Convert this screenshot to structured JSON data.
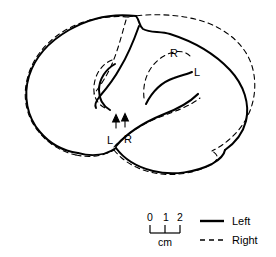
{
  "figure": {
    "type": "anatomical-line-drawing",
    "background_color": "#ffffff",
    "ink_color": "#000000"
  },
  "annotations": {
    "sylvian_left_label": "L",
    "sylvian_right_label": "R",
    "superior_right_label": "R",
    "superior_left_label": "L"
  },
  "scale_bar": {
    "ticks": [
      "0",
      "1",
      "2"
    ],
    "unit_label": "cm"
  },
  "legend": {
    "items": [
      {
        "label": "Left",
        "style": "solid",
        "color": "#000000"
      },
      {
        "label": "Right",
        "style": "dashed",
        "color": "#000000"
      }
    ]
  }
}
